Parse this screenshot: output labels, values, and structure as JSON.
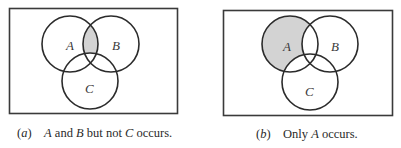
{
  "figures": [
    {
      "id": "a",
      "tag": "(a)",
      "caption_parts": [
        "A",
        " and ",
        "B",
        " but not ",
        "C",
        " occurs."
      ],
      "shaded_region": "A ∩ B ∩ Cᶜ",
      "labels": {
        "A": "A",
        "B": "B",
        "C": "C"
      }
    },
    {
      "id": "b",
      "tag": "(b)",
      "caption_parts": [
        "Only ",
        "A",
        " occurs."
      ],
      "shaded_region": "A ∩ Bᶜ ∩ Cᶜ",
      "labels": {
        "A": "A",
        "B": "B",
        "C": "C"
      }
    }
  ],
  "colors": {
    "stroke": "#2b2b2b",
    "frame": "#3a3a3a",
    "shade": "#d3d3d3",
    "background": "#ffffff"
  }
}
